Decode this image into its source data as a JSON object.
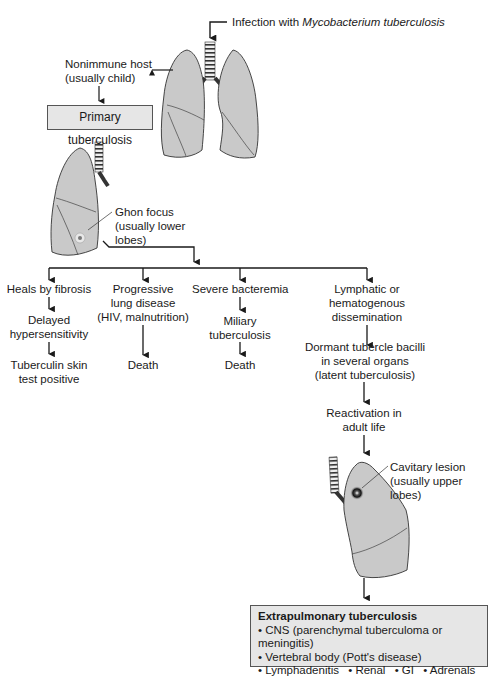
{
  "diagram": {
    "colors": {
      "lung_fill": "#c9c9c9",
      "lung_stroke": "#3a3a3a",
      "box_fill": "#e6e6e6",
      "box_border": "#555555",
      "line": "#1a1a1a",
      "background": "#ffffff"
    },
    "nodes": {
      "infection": {
        "prefix": "Infection with ",
        "organism": "Mycobacterium tuberculosis"
      },
      "nonimmune": {
        "line1": "Nonimmune host",
        "line2": "(usually child)"
      },
      "primary_tb": {
        "label": "Primary tuberculosis"
      },
      "ghon_focus": {
        "line1": "Ghon focus",
        "line2": "(usually lower",
        "line3": "lobes)"
      },
      "branches": [
        {
          "id": "fibrosis",
          "lines": [
            "Heals by fibrosis"
          ],
          "steps": [
            {
              "lines": [
                "Delayed",
                "hypersensitivity"
              ]
            },
            {
              "lines": [
                "Tuberculin skin",
                "test positive"
              ]
            }
          ]
        },
        {
          "id": "progressive",
          "lines": [
            "Progressive",
            "lung disease",
            "(HIV, malnutrition)"
          ],
          "steps": [
            {
              "lines": [
                "Death"
              ]
            }
          ]
        },
        {
          "id": "bacteremia",
          "lines": [
            "Severe bacteremia"
          ],
          "steps": [
            {
              "lines": [
                "Miliary",
                "tuberculosis"
              ]
            },
            {
              "lines": [
                "Death"
              ]
            }
          ]
        },
        {
          "id": "dissemination",
          "lines": [
            "Lymphatic or",
            "hematogenous",
            "dissemination"
          ],
          "steps": [
            {
              "lines": [
                "Dormant tubercle bacilli",
                "in several organs",
                "(latent tuberculosis)"
              ]
            },
            {
              "lines": [
                "Reactivation in",
                "adult life"
              ]
            }
          ]
        }
      ],
      "cavitary": {
        "line1": "Cavitary lesion",
        "line2": "(usually upper",
        "line3": "lobes)"
      },
      "extrapulmonary": {
        "title": "Extrapulmonary tuberculosis",
        "items": [
          "• CNS (parenchymal tuberculoma or meningitis)",
          "• Vertebral body (Pott's disease)"
        ],
        "inline_items": [
          "• Lymphadenitis",
          "• Renal",
          "• GI",
          "• Adrenals"
        ]
      }
    },
    "icons": [
      "lungs-pair-icon",
      "left-lung-ghon-icon",
      "right-lung-cavity-icon",
      "trachea-icon",
      "arrow-down-icon",
      "arrow-left-icon"
    ]
  }
}
